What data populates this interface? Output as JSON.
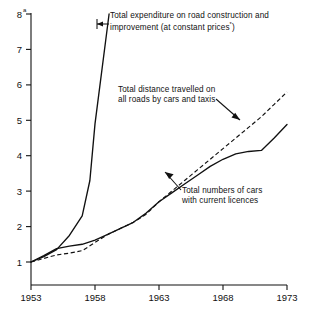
{
  "chart_data": {
    "type": "line",
    "title": "",
    "subtitle": "",
    "xlabel": "",
    "ylabel": "",
    "xlim": [
      1953,
      1973
    ],
    "ylim": [
      1,
      8
    ],
    "grid": false,
    "legend_position": "inline-annotations",
    "y_ticks": [
      1,
      2,
      3,
      4,
      5,
      6,
      7,
      8
    ],
    "y_tick_labels": [
      "1",
      "2",
      "3",
      "4",
      "5",
      "6",
      "7",
      "8"
    ],
    "y_top_footnote_marker": "a",
    "x_ticks": [
      1953,
      1958,
      1963,
      1968,
      1973
    ],
    "x_tick_labels": [
      "1953",
      "1958",
      "1963",
      "1968",
      "1973"
    ],
    "series": [
      {
        "name": "Total expenditure on road construction and improvement (at constant prices*)",
        "style": "solid",
        "x": [
          1953,
          1954,
          1955,
          1956,
          1957,
          1957.6,
          1958,
          1959.1
        ],
        "values": [
          1.0,
          1.15,
          1.35,
          1.75,
          2.3,
          3.3,
          4.9,
          8.0
        ]
      },
      {
        "name": "Total distance travelled on all roads by cars and taxis",
        "style": "dashed",
        "x": [
          1953,
          1954,
          1955,
          1956,
          1957,
          1958,
          1959,
          1960,
          1961,
          1962,
          1963,
          1964,
          1965,
          1966,
          1967,
          1968,
          1969,
          1970,
          1971,
          1972,
          1973
        ],
        "values": [
          1.0,
          1.1,
          1.2,
          1.25,
          1.32,
          1.55,
          1.78,
          1.95,
          2.12,
          2.35,
          2.7,
          3.0,
          3.3,
          3.6,
          3.9,
          4.2,
          4.5,
          4.8,
          5.1,
          5.45,
          5.8
        ]
      },
      {
        "name": "Total numbers of cars with current licences",
        "style": "solid",
        "x": [
          1953,
          1954,
          1955,
          1956,
          1957,
          1958,
          1959,
          1960,
          1961,
          1962,
          1963,
          1964,
          1965,
          1966,
          1967,
          1968,
          1969,
          1970,
          1971,
          1972,
          1973
        ],
        "values": [
          1.0,
          1.18,
          1.38,
          1.45,
          1.5,
          1.62,
          1.78,
          1.95,
          2.12,
          2.38,
          2.7,
          2.95,
          3.2,
          3.45,
          3.7,
          3.9,
          4.05,
          4.12,
          4.15,
          4.5,
          4.88
        ]
      }
    ],
    "annotations": [
      {
        "id": "expenditure",
        "line1": "Total expenditure on road construction and",
        "line2_prefix": "improvement (at constant prices",
        "line2_marker": "*",
        "line2_suffix": ")"
      },
      {
        "id": "distance",
        "line1": "Total distance travelled on",
        "line2": "all roads by cars and taxis"
      },
      {
        "id": "cars",
        "line1": "Total numbers of cars",
        "line2": "with current licences"
      }
    ]
  },
  "axes": {
    "y_label_1": "1",
    "y_label_2": "2",
    "y_label_3": "3",
    "y_label_4": "4",
    "y_label_5": "5",
    "y_label_6": "6",
    "y_label_7": "7",
    "y_label_8": "8",
    "y_footnote_marker": "a",
    "x_label_1": "1953",
    "x_label_2": "1958",
    "x_label_3": "1963",
    "x_label_4": "1968",
    "x_label_5": "1973"
  },
  "colors": {
    "ink": "#111111",
    "background": "#ffffff"
  }
}
